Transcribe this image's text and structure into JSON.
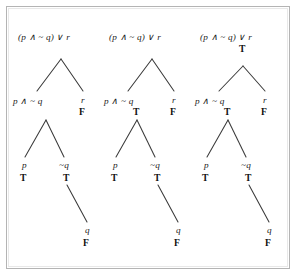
{
  "figure": {
    "caption": "",
    "background_color": "#ffffff",
    "border_color": "#b4b4b4",
    "line_color": "#3a3a3a",
    "text_color": "#1a1a1a"
  },
  "labels": {
    "root_formula": "(p ∧ ~ q) ∨ r",
    "left_subformula": "p ∧ ~ q",
    "right_atom": "r",
    "leaf_p": "p",
    "leaf_not_q": "~q",
    "leaf_q": "q",
    "true_value": "T",
    "false_value": "F"
  },
  "trees": [
    {
      "id": "tree-1",
      "name": "parse-tree-step-1",
      "nodes": {
        "root": {
          "text": "(p ∧ ~ q) ∨ r",
          "value": ""
        },
        "left": {
          "text": "p ∧ ~ q",
          "value": ""
        },
        "right": {
          "text": "r",
          "value": "F"
        },
        "leaf_p": {
          "text": "p",
          "value": "T"
        },
        "leaf_notq": {
          "text": "~q",
          "value": "T"
        },
        "leaf_q": {
          "text": "q",
          "value": "F"
        }
      }
    },
    {
      "id": "tree-2",
      "name": "parse-tree-step-2",
      "nodes": {
        "root": {
          "text": "(p ∧ ~ q) ∨ r",
          "value": ""
        },
        "left": {
          "text": "p ∧ ~ q",
          "value": "T"
        },
        "right": {
          "text": "r",
          "value": "F"
        },
        "leaf_p": {
          "text": "p",
          "value": "T"
        },
        "leaf_notq": {
          "text": "~q",
          "value": "T"
        },
        "leaf_q": {
          "text": "q",
          "value": "F"
        }
      }
    },
    {
      "id": "tree-3",
      "name": "parse-tree-step-3",
      "nodes": {
        "root": {
          "text": "(p ∧ ~ q) ∨ r",
          "value": "T"
        },
        "left": {
          "text": "p ∧ ~ q",
          "value": "T"
        },
        "right": {
          "text": "r",
          "value": "F"
        },
        "leaf_p": {
          "text": "p",
          "value": "T"
        },
        "leaf_notq": {
          "text": "~q",
          "value": "T"
        },
        "leaf_q": {
          "text": "q",
          "value": "F"
        }
      }
    }
  ]
}
